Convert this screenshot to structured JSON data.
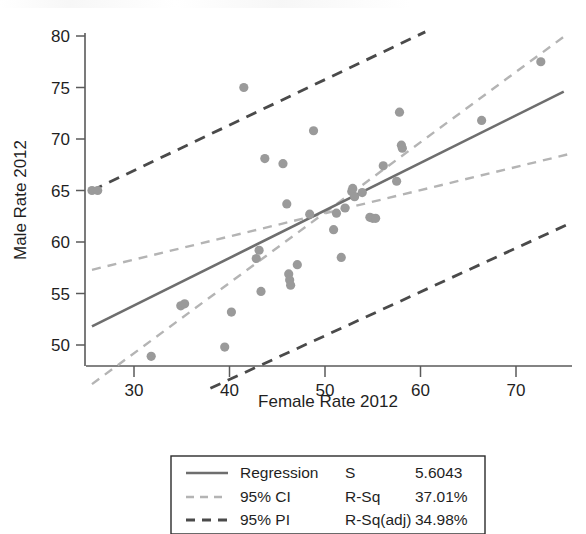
{
  "chart_data": {
    "type": "scatter",
    "title": "",
    "xlabel": "Female Rate 2012",
    "ylabel": "Male Rate 2012",
    "xlim": [
      25.0,
      75.8
    ],
    "ylim": [
      46.0,
      80.0
    ],
    "xticks": [
      30,
      40,
      50,
      60,
      70
    ],
    "xtick_labels": [
      "30",
      "40",
      "50",
      "60",
      "70"
    ],
    "yticks": [
      50,
      55,
      60,
      65,
      70,
      75,
      80
    ],
    "ytick_labels": [
      "50",
      "55",
      "60",
      "65",
      "70",
      "75",
      "80"
    ],
    "grid": false,
    "legend_position": "below-plot",
    "points": [
      [
        25.6,
        65.0
      ],
      [
        26.2,
        65.0
      ],
      [
        31.8,
        48.9
      ],
      [
        34.9,
        53.8
      ],
      [
        35.3,
        54.0
      ],
      [
        39.5,
        49.8
      ],
      [
        40.2,
        53.2
      ],
      [
        41.5,
        75.0
      ],
      [
        42.8,
        58.4
      ],
      [
        43.1,
        59.2
      ],
      [
        43.3,
        55.2
      ],
      [
        43.7,
        68.1
      ],
      [
        45.6,
        67.6
      ],
      [
        46.0,
        63.7
      ],
      [
        46.2,
        56.9
      ],
      [
        46.3,
        56.3
      ],
      [
        46.4,
        55.8
      ],
      [
        47.1,
        57.8
      ],
      [
        48.4,
        62.7
      ],
      [
        48.8,
        70.8
      ],
      [
        50.9,
        61.2
      ],
      [
        51.2,
        62.8
      ],
      [
        51.7,
        58.5
      ],
      [
        52.1,
        63.3
      ],
      [
        52.8,
        64.9
      ],
      [
        52.9,
        65.2
      ],
      [
        53.1,
        64.4
      ],
      [
        53.9,
        64.8
      ],
      [
        54.7,
        62.4
      ],
      [
        55.0,
        62.3
      ],
      [
        55.3,
        62.3
      ],
      [
        56.1,
        67.4
      ],
      [
        57.5,
        65.9
      ],
      [
        57.8,
        72.6
      ],
      [
        58.0,
        69.4
      ],
      [
        58.1,
        69.1
      ],
      [
        66.4,
        71.8
      ],
      [
        72.6,
        77.5
      ]
    ],
    "regression_line": {
      "name": "Regression",
      "x": [
        25.6,
        75.0
      ],
      "y": [
        51.8,
        74.6
      ],
      "style": "solid",
      "color": "#6e6e6e"
    },
    "ci_upper": {
      "name": "95% CI upper",
      "x": [
        25.6,
        75.4
      ],
      "y": [
        57.3,
        68.5
      ],
      "style": "dashed",
      "color": "#b4b4b4"
    },
    "ci_lower": {
      "name": "95% CI lower",
      "x": [
        25.6,
        75.4
      ],
      "y": [
        46.2,
        80.2
      ],
      "style": "dashed",
      "color": "#b4b4b4"
    },
    "pi_upper": {
      "name": "95% PI upper",
      "x": [
        25.6,
        60.5
      ],
      "y": [
        65.0,
        80.4
      ],
      "style": "dashed",
      "color": "#4a4a4a"
    },
    "pi_lower": {
      "name": "95% PI lower",
      "x": [
        38.0,
        75.4
      ],
      "y": [
        45.8,
        61.7
      ],
      "style": "dashed",
      "color": "#4a4a4a"
    }
  },
  "legend": {
    "rows": [
      {
        "swatch": "solid-line-swatch",
        "label": "Regression",
        "stat_name": "S",
        "stat_value": "5.6043"
      },
      {
        "swatch": "dashed-light-swatch",
        "label": "95% CI",
        "stat_name": "R-Sq",
        "stat_value": "37.01%"
      },
      {
        "swatch": "dashed-dark-swatch",
        "label": "95% PI",
        "stat_name": "R-Sq(adj)",
        "stat_value": "34.98%"
      }
    ]
  },
  "colors": {
    "regression": "#6e6e6e",
    "ci": "#b4b4b4",
    "pi": "#4a4a4a",
    "point": "#9a9a9a",
    "axis": "#5a5a5a",
    "text": "#1f1f1f",
    "background": "#ffffff"
  }
}
